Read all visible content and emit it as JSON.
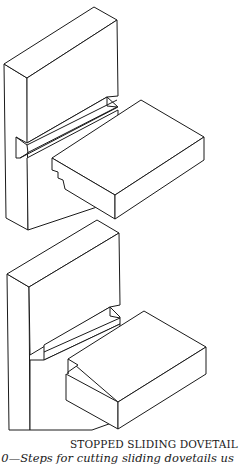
{
  "figure": {
    "title": "STOPPED SLIDING DOVETAIL",
    "subcaption": "10—Steps for cutting sliding dovetails us",
    "drawings": [
      {
        "name": "joint-upper",
        "description": "Vertical board with dovetail groove and shelf with dovetail tongue, separated"
      },
      {
        "name": "joint-lower",
        "description": "Stopped sliding dovetail: stopped groove in vertical board and notched shelf"
      }
    ]
  }
}
